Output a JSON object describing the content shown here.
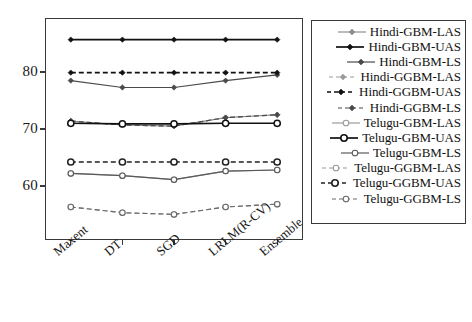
{
  "chart_data": {
    "type": "line",
    "title": "",
    "xlabel": "",
    "ylabel": "",
    "categories": [
      "Maxent",
      "DT",
      "SGD",
      "LRLM(R-CV)",
      "Ensemble"
    ],
    "ytick_labels": [
      "60",
      "70",
      "80"
    ],
    "yticks": [
      60,
      70,
      80
    ],
    "ylim": [
      50.5,
      89.5
    ],
    "grid": false,
    "legend_position": "right-outside",
    "series": [
      {
        "name": "Hindi-GBM-LAS",
        "values": [
          71.4,
          70.7,
          70.5,
          72.0,
          72.5
        ],
        "color": "#8c8c8c",
        "dash": "solid",
        "marker": "diamond-filled"
      },
      {
        "name": "Hindi-GBM-UAS",
        "values": [
          85.7,
          85.7,
          85.7,
          85.7,
          85.7
        ],
        "color": "#111111",
        "dash": "solid",
        "marker": "diamond-filled"
      },
      {
        "name": "Hindi-GBM-LS",
        "values": [
          78.5,
          77.3,
          77.3,
          78.5,
          79.5
        ],
        "color": "#4a4a4a",
        "dash": "solid",
        "marker": "diamond-filled"
      },
      {
        "name": "Hindi-GGBM-LAS",
        "values": [
          71.4,
          70.7,
          70.5,
          72.0,
          72.5
        ],
        "color": "#9a9a9a",
        "dash": "dashed",
        "marker": "diamond-filled"
      },
      {
        "name": "Hindi-GGBM-UAS",
        "values": [
          79.9,
          79.9,
          79.9,
          79.9,
          79.9
        ],
        "color": "#111111",
        "dash": "dashed",
        "marker": "diamond-filled"
      },
      {
        "name": "Hindi-GGBM-LS",
        "values": [
          71.4,
          70.7,
          70.5,
          72.0,
          72.5
        ],
        "color": "#4a4a4a",
        "dash": "dashed",
        "marker": "diamond-filled"
      },
      {
        "name": "Telugu-GBM-LAS",
        "values": [
          62.2,
          61.8,
          61.1,
          62.6,
          62.8
        ],
        "color": "#9a9a9a",
        "dash": "solid",
        "marker": "circle-open"
      },
      {
        "name": "Telugu-GBM-UAS",
        "values": [
          71.0,
          70.9,
          70.9,
          71.0,
          71.0
        ],
        "color": "#111111",
        "dash": "solid",
        "marker": "circle-open"
      },
      {
        "name": "Telugu-GBM-LS",
        "values": [
          62.2,
          61.8,
          61.1,
          62.6,
          62.8
        ],
        "color": "#5a5a5a",
        "dash": "solid",
        "marker": "circle-open"
      },
      {
        "name": "Telugu-GGBM-LAS",
        "values": [
          56.3,
          55.3,
          55.0,
          56.3,
          56.8
        ],
        "color": "#9a9a9a",
        "dash": "dashed",
        "marker": "circle-open"
      },
      {
        "name": "Telugu-GGBM-UAS",
        "values": [
          64.2,
          64.2,
          64.2,
          64.2,
          64.2
        ],
        "color": "#222222",
        "dash": "dashed",
        "marker": "circle-open"
      },
      {
        "name": "Telugu-GGBM-LS",
        "values": [
          56.3,
          55.3,
          55.0,
          56.3,
          56.8
        ],
        "color": "#6a6a6a",
        "dash": "dashed",
        "marker": "circle-open"
      }
    ]
  },
  "axes": {
    "frame_color": "#3a3a3a"
  },
  "legend": {
    "entries": [
      "Hindi-GBM-LAS",
      "Hindi-GBM-UAS",
      "Hindi-GBM-LS",
      "Hindi-GGBM-LAS",
      "Hindi-GGBM-UAS",
      "Hindi-GGBM-LS",
      "Telugu-GBM-LAS",
      "Telugu-GBM-UAS",
      "Telugu-GBM-LS",
      "Telugu-GGBM-LAS",
      "Telugu-GGBM-UAS",
      "Telugu-GGBM-LS"
    ]
  }
}
